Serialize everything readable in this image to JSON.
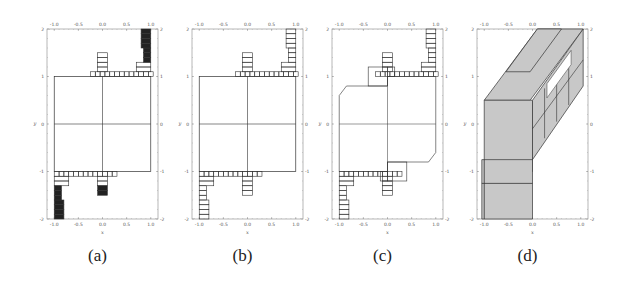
{
  "figure": {
    "panels": [
      {
        "id": "a",
        "caption": "(a)",
        "xlabel": "x",
        "ylabel": "y",
        "style": "filled-dense-grid"
      },
      {
        "id": "b",
        "caption": "(b)",
        "xlabel": "x",
        "ylabel": "y",
        "style": "grid-boxes"
      },
      {
        "id": "c",
        "caption": "(c)",
        "xlabel": "x",
        "ylabel": "y",
        "style": "merged-boxes"
      },
      {
        "id": "d",
        "caption": "(d)",
        "xlabel": "x",
        "ylabel": "y",
        "style": "3d-shaded-boxes"
      }
    ],
    "x_ticks": [
      "-1.0",
      "-0.5",
      "0.0",
      "0.5",
      "1.0"
    ],
    "y_ticks": [
      "2",
      "1",
      "0",
      "-1",
      "-2"
    ],
    "colors": {
      "line": "#333333",
      "fill_dark": "#222222",
      "fill_gray": "#c8c8c8",
      "frame": "#888888"
    }
  }
}
